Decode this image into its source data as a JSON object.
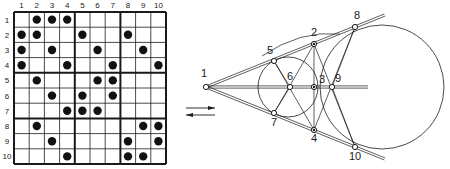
{
  "grid": {
    "rows": 10,
    "cols": 10,
    "col_labels": [
      "1",
      "2",
      "3",
      "4",
      "5",
      "6",
      "7",
      "8",
      "9",
      "10"
    ],
    "row_labels": [
      "1",
      "2",
      "3",
      "4",
      "5",
      "6",
      "7",
      "8",
      "9",
      "10"
    ],
    "block_boundaries": [
      4,
      7
    ],
    "dots": [
      [
        1,
        2
      ],
      [
        1,
        3
      ],
      [
        1,
        4
      ],
      [
        2,
        1
      ],
      [
        2,
        2
      ],
      [
        2,
        5
      ],
      [
        2,
        8
      ],
      [
        3,
        1
      ],
      [
        3,
        3
      ],
      [
        3,
        6
      ],
      [
        3,
        9
      ],
      [
        4,
        1
      ],
      [
        4,
        4
      ],
      [
        4,
        7
      ],
      [
        4,
        10
      ],
      [
        5,
        2
      ],
      [
        5,
        6
      ],
      [
        5,
        7
      ],
      [
        6,
        3
      ],
      [
        6,
        5
      ],
      [
        6,
        7
      ],
      [
        7,
        4
      ],
      [
        7,
        5
      ],
      [
        7,
        6
      ],
      [
        8,
        2
      ],
      [
        8,
        9
      ],
      [
        8,
        10
      ],
      [
        9,
        3
      ],
      [
        9,
        8
      ],
      [
        9,
        10
      ],
      [
        10,
        4
      ],
      [
        10,
        8
      ],
      [
        10,
        9
      ]
    ]
  },
  "geometry": {
    "points": [
      {
        "label": "1",
        "x": 206,
        "y": 87
      },
      {
        "label": "2",
        "x": 314,
        "y": 44
      },
      {
        "label": "3",
        "x": 314,
        "y": 87
      },
      {
        "label": "4",
        "x": 314,
        "y": 130
      },
      {
        "label": "5",
        "x": 274,
        "y": 61
      },
      {
        "label": "6",
        "x": 290,
        "y": 87
      },
      {
        "label": "7",
        "x": 274,
        "y": 113
      },
      {
        "label": "8",
        "x": 355,
        "y": 27
      },
      {
        "label": "9",
        "x": 332,
        "y": 87
      },
      {
        "label": "10",
        "x": 355,
        "y": 147
      }
    ],
    "small_circle": {
      "cx": 288,
      "cy": 87,
      "r": 30
    },
    "large_circle": {
      "cx": 382,
      "cy": 87,
      "r": 62
    },
    "arrows": [
      {
        "direction": "right",
        "y": 108
      },
      {
        "direction": "left",
        "y": 115
      }
    ]
  },
  "colors": {
    "line": "#1a1a1a",
    "dot": "#111111",
    "background": "#ffffff"
  }
}
